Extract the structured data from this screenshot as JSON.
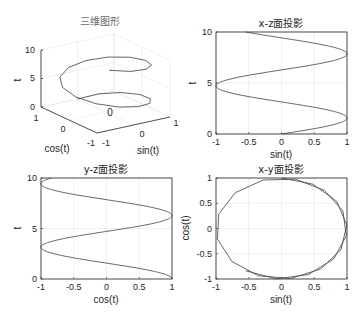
{
  "figure": {
    "background": "#ffffff",
    "line_color": "#555555",
    "axis_color": "#262626",
    "grid_color": "#e6e6e6"
  },
  "chart_data": [
    {
      "type": "line",
      "subtype": "3d-line",
      "title": "三维图形",
      "xlabel": "sin(t)",
      "ylabel": "cos(t)",
      "zlabel": "t",
      "xlim": [
        -1,
        1
      ],
      "ylim": [
        -1,
        1
      ],
      "zlim": [
        0,
        10
      ],
      "xticks": [
        "-1",
        "0",
        "1"
      ],
      "yticks": [
        "-1",
        "0",
        "1"
      ],
      "zticks": [
        "0",
        "5",
        "10"
      ],
      "grid": true,
      "series": [
        {
          "name": "helix",
          "x": "sin(t)",
          "y": "cos(t)",
          "z": "t",
          "t_range": [
            0,
            10
          ],
          "step": 0.5
        }
      ]
    },
    {
      "type": "line",
      "title": "x-z面投影",
      "xlabel": "sin(t)",
      "ylabel": "t",
      "xlim": [
        -1,
        1
      ],
      "ylim": [
        0,
        10
      ],
      "xticks": [
        "-1",
        "-0.5",
        "0",
        "0.5",
        "1"
      ],
      "yticks": [
        "0",
        "5",
        "10"
      ],
      "grid": true,
      "series": [
        {
          "name": "x-z",
          "x": "sin(t)",
          "y": "t",
          "t_range": [
            0,
            10
          ]
        }
      ]
    },
    {
      "type": "line",
      "title": "y-z面投影",
      "xlabel": "cos(t)",
      "ylabel": "t",
      "xlim": [
        -1,
        1
      ],
      "ylim": [
        0,
        10
      ],
      "xticks": [
        "-1",
        "-0.5",
        "0",
        "0.5",
        "1"
      ],
      "yticks": [
        "0",
        "5",
        "10"
      ],
      "grid": true,
      "series": [
        {
          "name": "y-z",
          "x": "cos(t)",
          "y": "t",
          "t_range": [
            0,
            10
          ]
        }
      ]
    },
    {
      "type": "line",
      "title": "x-y面投影",
      "xlabel": "sin(t)",
      "ylabel": "cos(t)",
      "xlim": [
        -1,
        1
      ],
      "ylim": [
        -1,
        1
      ],
      "xticks": [
        "-1",
        "-0.5",
        "0",
        "0.5",
        "1"
      ],
      "yticks": [
        "-1",
        "-0.5",
        "0",
        "0.5",
        "1"
      ],
      "grid": true,
      "series": [
        {
          "name": "x-y",
          "x": "sin(t)",
          "y": "cos(t)",
          "t_range": [
            0,
            10
          ],
          "step": 0.5
        }
      ]
    }
  ]
}
